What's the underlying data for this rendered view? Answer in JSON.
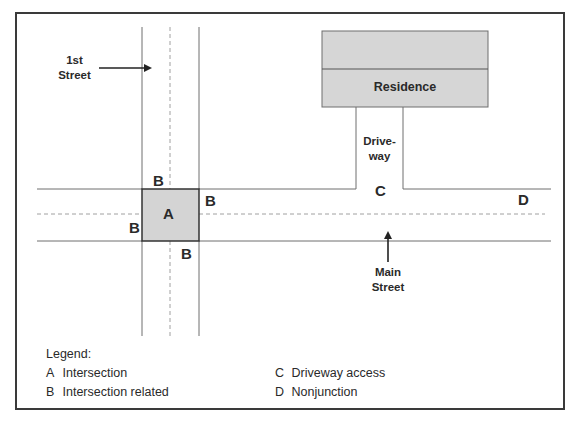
{
  "diagram": {
    "colors": {
      "border": "#3a3a3a",
      "road_line": "#6e6e6e",
      "center_dash": "#a0a0a0",
      "intersection_fill": "#d4d4d4",
      "residence_fill": "#d6d6d6",
      "text": "#2a2a2a"
    },
    "streets": {
      "first_street": "1st\nStreet",
      "first_street_line1": "1st",
      "first_street_line2": "Street",
      "main_street_line1": "Main",
      "main_street_line2": "Street"
    },
    "residence": {
      "label": "Residence"
    },
    "driveway": {
      "line1": "Drive-",
      "line2": "way"
    },
    "markers": {
      "intersection": "A",
      "related_top": "B",
      "related_right": "B",
      "related_left": "B",
      "related_bottom": "B",
      "driveway_access": "C",
      "nonjunction": "D"
    }
  },
  "legend": {
    "title": "Legend:",
    "items": [
      {
        "key": "A",
        "label": "Intersection"
      },
      {
        "key": "B",
        "label": "Intersection related"
      },
      {
        "key": "C",
        "label": "Driveway access"
      },
      {
        "key": "D",
        "label": "Nonjunction"
      }
    ]
  }
}
